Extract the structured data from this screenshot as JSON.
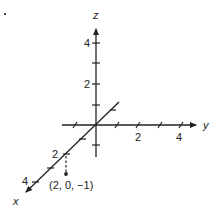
{
  "diagram": {
    "type": "3d-coordinate-axes",
    "axes": {
      "x": {
        "label": "x",
        "tick_labels": [
          "2",
          "4"
        ]
      },
      "y": {
        "label": "y",
        "tick_labels": [
          "2",
          "4"
        ]
      },
      "z": {
        "label": "z",
        "tick_labels": [
          "2",
          "4"
        ]
      }
    },
    "point": {
      "label": "(2, 0, −1)",
      "coords": [
        2,
        0,
        -1
      ]
    },
    "colors": {
      "ink": "#222222",
      "background": "#ffffff"
    }
  }
}
